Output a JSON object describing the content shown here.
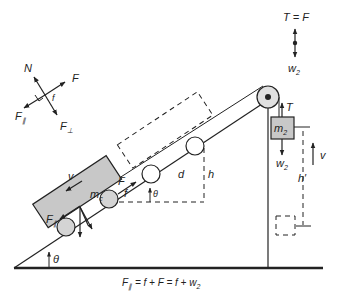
{
  "diagram": {
    "type": "physics-free-body",
    "colors": {
      "ink": "#222222",
      "cart_fill": "#c8c8c8",
      "block_fill": "#c8c8c8",
      "wheel_fill": "#d4d4d4"
    },
    "free_body_left": {
      "N": "N",
      "F": "F",
      "f": "f",
      "F_par": "F",
      "F_par_sub": "∥",
      "F_perp": "F",
      "F_perp_sub": "⊥"
    },
    "free_body_right": {
      "top": "T = F",
      "bottom": "w",
      "bottom_sub": "2"
    },
    "incline": {
      "theta": "θ",
      "theta_small": "θ",
      "d": "d",
      "h": "h"
    },
    "cart": {
      "mass": "m",
      "mass_sub": "c",
      "v": "v",
      "F": "F",
      "f": "f",
      "F_par": "F",
      "F_par_sub": "∥"
    },
    "hanging_block": {
      "mass": "m",
      "mass_sub": "2",
      "T": "T",
      "w": "w",
      "w_sub": "2",
      "v": "v",
      "h_prime": "h′"
    },
    "equation": {
      "lhs": "F",
      "lhs_sub": "∥",
      "rhs": " = f + F = f + w",
      "rhs_sub": "2"
    }
  }
}
